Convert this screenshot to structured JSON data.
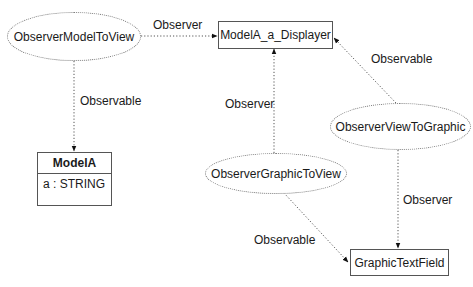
{
  "diagram": {
    "nodes": {
      "observer_model_to_view": {
        "label": "ObserverModelToView",
        "shape": "ellipse"
      },
      "modela_a_displayer": {
        "label": "ModelA_a_Displayer",
        "shape": "box"
      },
      "modela": {
        "label": "ModelA",
        "attributes": [
          "a : STRING"
        ],
        "shape": "class"
      },
      "observer_view_to_graphic": {
        "label": "ObserverViewToGraphic",
        "shape": "ellipse"
      },
      "observer_graphic_to_view": {
        "label": "ObserverGraphicToView",
        "shape": "ellipse"
      },
      "graphic_text_field": {
        "label": "GraphicTextField",
        "shape": "box"
      }
    },
    "edges": [
      {
        "from": "ObserverModelToView",
        "to": "ModelA_a_Displayer",
        "label": "Observer"
      },
      {
        "from": "ObserverModelToView",
        "to": "ModelA",
        "label": "Observable"
      },
      {
        "from": "ObserverGraphicToView",
        "to": "ModelA_a_Displayer",
        "label": "Observer"
      },
      {
        "from": "ObserverViewToGraphic",
        "to": "ModelA_a_Displayer",
        "label": "Observable"
      },
      {
        "from": "ObserverViewToGraphic",
        "to": "GraphicTextField",
        "label": "Observer"
      },
      {
        "from": "ObserverGraphicToView",
        "to": "GraphicTextField",
        "label": "Observable"
      }
    ]
  }
}
